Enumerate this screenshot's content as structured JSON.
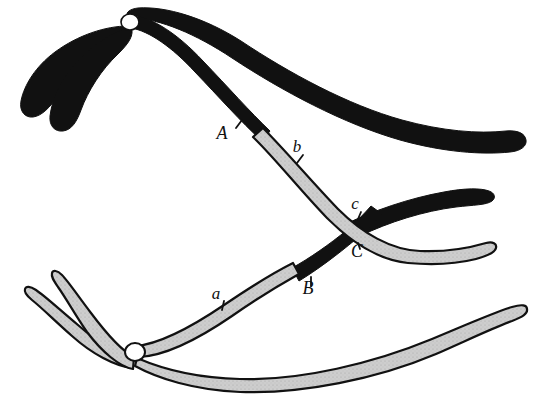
{
  "figure": {
    "title": "",
    "caption": "",
    "background_color": "#ffffff"
  },
  "colors": {
    "dark_chromosome": "#111111",
    "light_chromosome": "#c9c9c9",
    "outline": "#111111",
    "centromere_fill": "#ffffff",
    "page_background": "#ffffff"
  },
  "centromeres": [
    {
      "name": "upper-centromere",
      "x": 130,
      "y": 22,
      "rx": 9,
      "ry": 8
    },
    {
      "name": "lower-centromere",
      "x": 135,
      "y": 352,
      "rx": 10,
      "ry": 9
    }
  ],
  "labels": [
    {
      "id": "A",
      "text": "A",
      "x": 222,
      "y": 139,
      "tick_x1": 236,
      "tick_y1": 128,
      "tick_x2": 242,
      "tick_y2": 120,
      "size": "big"
    },
    {
      "id": "b",
      "text": "b",
      "x": 297,
      "y": 152,
      "tick_x1": 303,
      "tick_y1": 155,
      "tick_x2": 297,
      "tick_y2": 163,
      "size": "small"
    },
    {
      "id": "c",
      "text": "c",
      "x": 355,
      "y": 209,
      "tick_x1": 361,
      "tick_y1": 212,
      "tick_x2": 358,
      "tick_y2": 219,
      "size": "small"
    },
    {
      "id": "C",
      "text": "C",
      "x": 357,
      "y": 257,
      "tick_x1": 358,
      "tick_y1": 243,
      "tick_x2": 360,
      "tick_y2": 249,
      "size": "big"
    },
    {
      "id": "B",
      "text": "B",
      "x": 308,
      "y": 294,
      "tick_x1": 311,
      "tick_y1": 277,
      "tick_x2": 311,
      "tick_y2": 286,
      "size": "big"
    },
    {
      "id": "a",
      "text": "a",
      "x": 216,
      "y": 299,
      "tick_x1": 224,
      "tick_y1": 301,
      "tick_x2": 222,
      "tick_y2": 310,
      "size": "small"
    }
  ],
  "chromatids": [
    {
      "name": "dark-upper-left-outer-arm",
      "color_key": "dark_chromosome",
      "origin": "upper-centromere",
      "note": "black arm sweeping down and to the far left, blunt tip"
    },
    {
      "name": "dark-upper-left-inner-arm",
      "color_key": "dark_chromosome",
      "origin": "upper-centromere",
      "note": "black arm sweeping down-left, shorter, tip lower"
    },
    {
      "name": "dark-upper-right-long-arm",
      "color_key": "dark_chromosome",
      "origin": "upper-centromere",
      "note": "uncrossed black chromatid sweeping right to the page edge"
    },
    {
      "name": "crossover-chromatid-A-b-c",
      "color_key": "dark_chromosome",
      "origin": "upper-centromere",
      "note": "starts black from upper centromere through locus A, then continues as light gray through b and c, ending at right middle"
    },
    {
      "name": "light-lower-left-outer-arm",
      "color_key": "light_chromosome",
      "origin": "lower-centromere",
      "note": "gray arm sweeping up and to the far left"
    },
    {
      "name": "light-lower-left-inner-arm",
      "color_key": "light_chromosome",
      "origin": "lower-centromere",
      "note": "gray arm sweeping up-left, shorter"
    },
    {
      "name": "light-lower-right-long-arm",
      "color_key": "light_chromosome",
      "origin": "lower-centromere",
      "note": "uncrossed gray chromatid sweeping right to the page edge"
    },
    {
      "name": "crossover-chromatid-a-B-C",
      "color_key": "light_chromosome",
      "origin": "lower-centromere",
      "note": "starts light gray from lower centromere through locus a, then continues as black through B and C, ending at right middle"
    }
  ],
  "chiasma": {
    "name": "chiasma-crossing-point",
    "x": 352,
    "y": 231,
    "note": "point where the two recombinant chromatids cross"
  }
}
